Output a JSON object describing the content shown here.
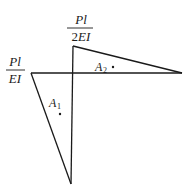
{
  "diagram": {
    "type": "moment-area-diagram",
    "labels": {
      "left_fraction": {
        "numerator": "Pl",
        "denominator": "EI"
      },
      "top_fraction": {
        "numerator": "Pl",
        "denominator_prefix": "2",
        "denominator": "EI"
      },
      "area1": {
        "letter": "A",
        "subscript": "1"
      },
      "area2": {
        "letter": "A",
        "subscript": "2"
      }
    },
    "colors": {
      "stroke": "#1a1a1a",
      "background": "#ffffff"
    }
  }
}
